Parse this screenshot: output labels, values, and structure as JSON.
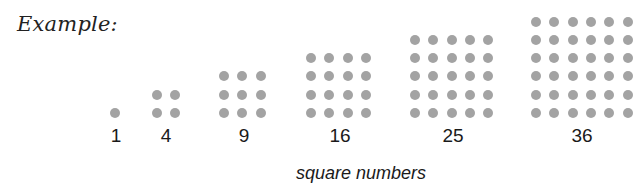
{
  "title": "Example:",
  "caption": "square numbers",
  "dot_color": "#a3a3a3",
  "groups": [
    {
      "n": 1,
      "label": "1",
      "x0": 115,
      "label_x": 116
    },
    {
      "n": 2,
      "label": "4",
      "x0": 157,
      "label_x": 166
    },
    {
      "n": 3,
      "label": "9",
      "x0": 224,
      "label_x": 244
    },
    {
      "n": 4,
      "label": "16",
      "x0": 311,
      "label_x": 340
    },
    {
      "n": 5,
      "label": "25",
      "x0": 415,
      "label_x": 453
    },
    {
      "n": 6,
      "label": "36",
      "x0": 536,
      "label_x": 582
    }
  ]
}
